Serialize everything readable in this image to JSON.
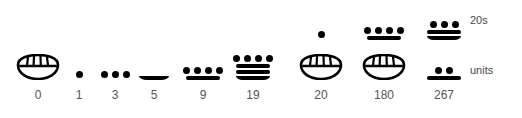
{
  "figure": {
    "background_color": "#ffffff",
    "ink_color": "#000000",
    "label_color": "#555555"
  },
  "row_labels": {
    "twenties": "20s",
    "units": "units"
  },
  "chart_data": {
    "type": "table",
    "xlabel": "",
    "ylabel": "",
    "grid": false,
    "legend": [
      "20s",
      "units"
    ],
    "legend_position": "right",
    "rows": [
      "20s",
      "units"
    ],
    "categories": [
      "0",
      "1",
      "3",
      "5",
      "9",
      "19",
      "20",
      "180",
      "267"
    ],
    "values": [
      0,
      1,
      3,
      5,
      9,
      19,
      20,
      180,
      267
    ],
    "columns": [
      {
        "label": "0",
        "value": 0,
        "x": 38,
        "twenties": null,
        "units": {
          "glyph": "shell",
          "dots": 0,
          "bars": 0,
          "value": 0
        }
      },
      {
        "label": "1",
        "value": 1,
        "x": 79,
        "twenties": null,
        "units": {
          "glyph": "dots-bars",
          "dots": 1,
          "bars": 0,
          "value": 1
        }
      },
      {
        "label": "3",
        "value": 3,
        "x": 115,
        "twenties": null,
        "units": {
          "glyph": "dots-bars",
          "dots": 3,
          "bars": 0,
          "value": 3
        }
      },
      {
        "label": "5",
        "value": 5,
        "x": 154,
        "twenties": null,
        "units": {
          "glyph": "dots-bars",
          "dots": 0,
          "bars": 1,
          "value": 5
        }
      },
      {
        "label": "9",
        "value": 9,
        "x": 203,
        "twenties": null,
        "units": {
          "glyph": "dots-bars",
          "dots": 4,
          "bars": 1,
          "value": 9
        }
      },
      {
        "label": "19",
        "value": 19,
        "x": 253,
        "twenties": null,
        "units": {
          "glyph": "dots-bars",
          "dots": 4,
          "bars": 3,
          "value": 19
        }
      },
      {
        "label": "20",
        "value": 20,
        "x": 321,
        "twenties": {
          "glyph": "dots-bars",
          "dots": 1,
          "bars": 0,
          "value": 1
        },
        "units": {
          "glyph": "shell",
          "dots": 0,
          "bars": 0,
          "value": 0
        }
      },
      {
        "label": "180",
        "value": 180,
        "x": 384,
        "twenties": {
          "glyph": "dots-bars",
          "dots": 4,
          "bars": 1,
          "value": 9
        },
        "units": {
          "glyph": "shell",
          "dots": 0,
          "bars": 0,
          "value": 0
        }
      },
      {
        "label": "267",
        "value": 267,
        "x": 444,
        "twenties": {
          "glyph": "dots-bars",
          "dots": 3,
          "bars": 2,
          "value": 13
        },
        "units": {
          "glyph": "dots-bars",
          "dots": 2,
          "bars": 1,
          "value": 7
        }
      }
    ]
  }
}
